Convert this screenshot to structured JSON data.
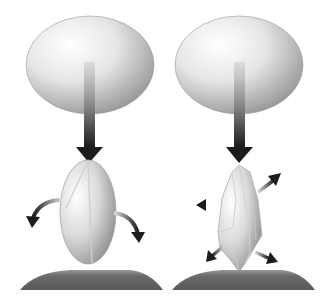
{
  "diagram": {
    "colors": {
      "background": "#ffffff",
      "ellipse_light": "#ffffff",
      "ellipse_dark": "#9a9a9a",
      "arrow_dark": "#1f1f1f",
      "ground": "#6e6e6e",
      "outline": "#8a8a8a"
    },
    "panels": [
      {
        "id": "left",
        "label": "",
        "top_body": "smooth-ellipsoid-press",
        "force": "down-arrow",
        "object": "split-ellipsoid",
        "reaction_arrows": [
          "curved-left-down",
          "curved-right-down"
        ]
      },
      {
        "id": "right",
        "label": "",
        "top_body": "smooth-ellipsoid-press",
        "force": "down-arrow",
        "object": "faceted-crystal",
        "reaction_arrows": [
          "up-right",
          "left",
          "down-left",
          "down-right"
        ]
      }
    ]
  }
}
